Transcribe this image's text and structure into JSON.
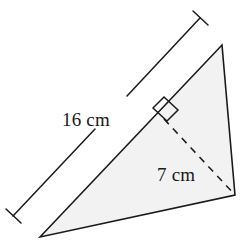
{
  "figure": {
    "kind": "geometry-diagram",
    "shape": "triangle",
    "background_color": "#ffffff",
    "triangle": {
      "fill_color": "#f2f2f2",
      "stroke_color": "#1a1a1a",
      "stroke_width": 1.6,
      "vertices": [
        {
          "name": "bottom-left",
          "x": 40,
          "y": 237
        },
        {
          "name": "top-right",
          "x": 222,
          "y": 45
        },
        {
          "name": "bottom-right",
          "x": 235,
          "y": 195
        }
      ]
    },
    "dimension_line": {
      "label": "16 cm",
      "value": 16,
      "unit": "cm",
      "measures": "base",
      "stroke_color": "#1a1a1a",
      "stroke_width": 1.5,
      "start": {
        "x": 13,
        "y": 216
      },
      "end": {
        "x": 200,
        "y": 18
      },
      "break_start": {
        "x": 95,
        "y": 129
      },
      "break_end": {
        "x": 125,
        "y": 97
      },
      "tick_length": 13,
      "label_position": {
        "x": 62,
        "y": 126
      },
      "label_font_size": 19
    },
    "altitude": {
      "label": "7 cm",
      "value": 7,
      "unit": "cm",
      "measures": "height",
      "style": "dashed",
      "dash_pattern": "7 6",
      "stroke_color": "#1a1a1a",
      "stroke_width": 1.5,
      "start": {
        "x": 164,
        "y": 119
      },
      "end": {
        "x": 235,
        "y": 195
      },
      "label_position": {
        "x": 157,
        "y": 181
      },
      "label_font_size": 19
    },
    "right_angle_marker": {
      "name": "right-angle-square",
      "stroke_color": "#1a1a1a",
      "stroke_width": 1.5,
      "size": 14,
      "at": {
        "x": 164,
        "y": 119
      },
      "points": "153,108 164,97 178,110 167,121"
    }
  }
}
